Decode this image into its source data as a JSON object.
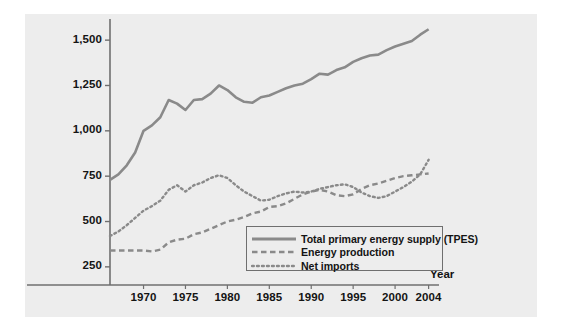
{
  "chart_data": {
    "type": "line",
    "title": "",
    "subtitle": "",
    "xlabel": "Year",
    "ylabel": "",
    "xlim": [
      1966,
      2005
    ],
    "ylim": [
      150,
      1600
    ],
    "grid": false,
    "legend_position": "bottom-center-inside",
    "x_ticks": [
      1970,
      1975,
      1980,
      1985,
      1990,
      1995,
      2000,
      2004
    ],
    "x_tick_labels": [
      "1970",
      "1975",
      "1980",
      "1985",
      "1990",
      "1995",
      "2000",
      "2004"
    ],
    "y_ticks": [
      250,
      500,
      750,
      1000,
      1250,
      1500
    ],
    "y_tick_labels": [
      "250",
      "500",
      "750",
      "1,000",
      "1,250",
      "1,500"
    ],
    "x": [
      1966,
      1967,
      1968,
      1969,
      1970,
      1971,
      1972,
      1973,
      1974,
      1975,
      1976,
      1977,
      1978,
      1979,
      1980,
      1981,
      1982,
      1983,
      1984,
      1985,
      1986,
      1987,
      1988,
      1989,
      1990,
      1991,
      1992,
      1993,
      1994,
      1995,
      1996,
      1997,
      1998,
      1999,
      2000,
      2001,
      2002,
      2003,
      2004
    ],
    "series": [
      {
        "name": "Total primary energy supply (TPES)",
        "style": "solid",
        "color": "#8a8a8a",
        "values": [
          730,
          760,
          810,
          880,
          1000,
          1030,
          1075,
          1170,
          1150,
          1115,
          1170,
          1175,
          1205,
          1250,
          1225,
          1185,
          1160,
          1155,
          1185,
          1195,
          1215,
          1235,
          1250,
          1260,
          1285,
          1315,
          1310,
          1335,
          1350,
          1380,
          1400,
          1415,
          1420,
          1445,
          1465,
          1480,
          1495,
          1530,
          1560
        ]
      },
      {
        "name": "Energy production",
        "style": "dashed",
        "color": "#8a8a8a",
        "values": [
          340,
          340,
          340,
          340,
          340,
          335,
          345,
          385,
          400,
          405,
          430,
          440,
          460,
          480,
          500,
          510,
          525,
          545,
          555,
          580,
          585,
          600,
          625,
          650,
          665,
          675,
          665,
          645,
          640,
          650,
          680,
          700,
          710,
          725,
          740,
          750,
          755,
          760,
          765
        ]
      },
      {
        "name": "Net imports",
        "style": "dotted",
        "color": "#8a8a8a",
        "values": [
          420,
          445,
          480,
          520,
          560,
          585,
          615,
          675,
          700,
          665,
          700,
          715,
          740,
          755,
          740,
          700,
          665,
          640,
          615,
          620,
          640,
          655,
          665,
          660,
          665,
          680,
          690,
          700,
          705,
          690,
          660,
          640,
          630,
          640,
          665,
          690,
          720,
          760,
          840
        ]
      }
    ]
  },
  "legend": {
    "items": [
      {
        "label": "Total primary energy supply (TPES)",
        "style": "solid"
      },
      {
        "label": "Energy production",
        "style": "dashed"
      },
      {
        "label": "Net imports",
        "style": "dotted"
      }
    ]
  },
  "axes": {
    "x_axis_title": "Year"
  },
  "colors": {
    "panel_background": "#ededed",
    "figure_background": "#ffffff",
    "line": "#8a8a8a",
    "axis": "#6f6f6f",
    "text": "#141414"
  }
}
